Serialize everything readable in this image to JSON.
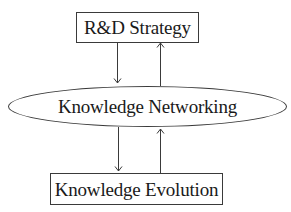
{
  "diagram": {
    "type": "flow",
    "nodes": [
      {
        "id": "rd_strategy",
        "label": "R&D Strategy",
        "shape": "rectangle"
      },
      {
        "id": "knowledge_networking",
        "label": "Knowledge Networking",
        "shape": "ellipse"
      },
      {
        "id": "knowledge_evolution",
        "label": "Knowledge Evolution",
        "shape": "rectangle"
      }
    ],
    "edges": [
      {
        "from": "rd_strategy",
        "to": "knowledge_networking",
        "direction": "down"
      },
      {
        "from": "knowledge_networking",
        "to": "rd_strategy",
        "direction": "up"
      },
      {
        "from": "knowledge_networking",
        "to": "knowledge_evolution",
        "direction": "down"
      },
      {
        "from": "knowledge_evolution",
        "to": "knowledge_networking",
        "direction": "up"
      }
    ],
    "colors": {
      "stroke": "#3a3a3a",
      "text": "#1a1a1a",
      "background": "#ffffff"
    }
  }
}
